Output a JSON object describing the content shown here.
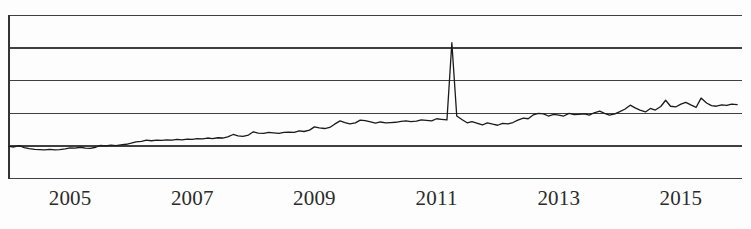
{
  "chart_data": {
    "type": "line",
    "title": "",
    "subtitle": "",
    "xlabel": "",
    "ylabel": "",
    "grid": true,
    "legend_position": "none",
    "legend": [],
    "annotations": [],
    "xlim": [
      2004.0,
      2016.0
    ],
    "ylim": [
      0,
      6
    ],
    "yticks": [
      0,
      1,
      2,
      3,
      4,
      5
    ],
    "ytick_labels": [
      "",
      "",
      "",
      "",
      "",
      ""
    ],
    "xticks": [
      2005,
      2007,
      2009,
      2011,
      2013,
      2015
    ],
    "xtick_labels": [
      "2005",
      "2007",
      "2009",
      "2011",
      "2013",
      "2015"
    ],
    "series": [
      {
        "name": "series-1",
        "color": "#1a1a1a",
        "x": [
          2004.0,
          2004.08,
          2004.17,
          2004.25,
          2004.33,
          2004.42,
          2004.5,
          2004.58,
          2004.67,
          2004.75,
          2004.83,
          2004.92,
          2005.0,
          2005.08,
          2005.17,
          2005.25,
          2005.33,
          2005.42,
          2005.5,
          2005.58,
          2005.67,
          2005.75,
          2005.83,
          2005.92,
          2006.0,
          2006.08,
          2006.17,
          2006.25,
          2006.33,
          2006.42,
          2006.5,
          2006.58,
          2006.67,
          2006.75,
          2006.83,
          2006.92,
          2007.0,
          2007.08,
          2007.17,
          2007.25,
          2007.33,
          2007.42,
          2007.5,
          2007.58,
          2007.67,
          2007.75,
          2007.83,
          2007.92,
          2008.0,
          2008.08,
          2008.17,
          2008.25,
          2008.33,
          2008.42,
          2008.5,
          2008.58,
          2008.67,
          2008.75,
          2008.83,
          2008.92,
          2009.0,
          2009.08,
          2009.17,
          2009.25,
          2009.33,
          2009.42,
          2009.5,
          2009.58,
          2009.67,
          2009.75,
          2009.83,
          2009.92,
          2010.0,
          2010.08,
          2010.17,
          2010.25,
          2010.33,
          2010.42,
          2010.5,
          2010.58,
          2010.67,
          2010.75,
          2010.83,
          2010.92,
          2011.0,
          2011.08,
          2011.17,
          2011.25,
          2011.33,
          2011.42,
          2011.5,
          2011.58,
          2011.67,
          2011.75,
          2011.83,
          2011.92,
          2012.0,
          2012.08,
          2012.17,
          2012.25,
          2012.33,
          2012.42,
          2012.5,
          2012.58,
          2012.67,
          2012.75,
          2012.83,
          2012.92,
          2013.0,
          2013.08,
          2013.17,
          2013.25,
          2013.33,
          2013.42,
          2013.5,
          2013.58,
          2013.67,
          2013.75,
          2013.83,
          2013.92,
          2014.0,
          2014.08,
          2014.17,
          2014.25,
          2014.33,
          2014.42,
          2014.5,
          2014.58,
          2014.67,
          2014.75,
          2014.83,
          2014.92,
          2015.0,
          2015.08,
          2015.17,
          2015.25,
          2015.33,
          2015.42,
          2015.5,
          2015.58,
          2015.67,
          2015.75,
          2015.83,
          2015.92
        ],
        "values": [
          1.18,
          1.16,
          1.21,
          1.14,
          1.1,
          1.07,
          1.06,
          1.05,
          1.07,
          1.05,
          1.06,
          1.09,
          1.13,
          1.12,
          1.15,
          1.12,
          1.11,
          1.15,
          1.22,
          1.2,
          1.23,
          1.21,
          1.24,
          1.26,
          1.3,
          1.35,
          1.37,
          1.41,
          1.39,
          1.41,
          1.4,
          1.42,
          1.41,
          1.44,
          1.42,
          1.45,
          1.44,
          1.47,
          1.46,
          1.49,
          1.47,
          1.5,
          1.49,
          1.53,
          1.62,
          1.57,
          1.55,
          1.6,
          1.72,
          1.67,
          1.66,
          1.7,
          1.68,
          1.66,
          1.7,
          1.71,
          1.7,
          1.75,
          1.73,
          1.78,
          1.9,
          1.86,
          1.84,
          1.88,
          2.0,
          2.12,
          2.06,
          2.01,
          2.05,
          2.15,
          2.13,
          2.08,
          2.04,
          2.08,
          2.05,
          2.06,
          2.07,
          2.1,
          2.12,
          2.09,
          2.11,
          2.16,
          2.14,
          2.12,
          2.2,
          2.18,
          2.16,
          5.0,
          2.3,
          2.16,
          2.05,
          2.09,
          2.03,
          1.97,
          2.05,
          2.0,
          1.96,
          2.03,
          2.01,
          2.06,
          2.15,
          2.22,
          2.2,
          2.34,
          2.4,
          2.38,
          2.3,
          2.36,
          2.33,
          2.3,
          2.4,
          2.35,
          2.36,
          2.38,
          2.33,
          2.42,
          2.48,
          2.4,
          2.33,
          2.38,
          2.46,
          2.55,
          2.7,
          2.6,
          2.52,
          2.45,
          2.58,
          2.52,
          2.65,
          2.88,
          2.66,
          2.64,
          2.74,
          2.8,
          2.7,
          2.62,
          2.96,
          2.78,
          2.68,
          2.66,
          2.71,
          2.69,
          2.74,
          2.72
        ]
      }
    ]
  },
  "axis": {
    "xtick_labels": [
      "2005",
      "2007",
      "2009",
      "2011",
      "2013",
      "2015"
    ]
  },
  "style": {
    "line_color": "#1a1a1a",
    "grid_color": "#404040",
    "axis_color": "#333333",
    "background": "#fdfdfd",
    "tick_text_color": "#2b2b2b"
  }
}
